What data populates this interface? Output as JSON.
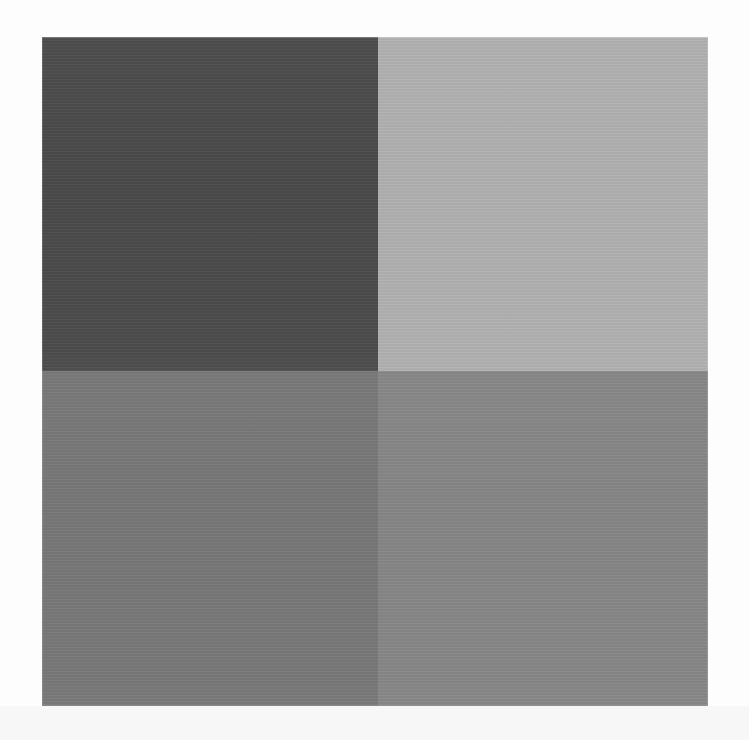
{
  "page": {
    "width": 749,
    "height": 740,
    "background_color": "#fdfdfd",
    "lower_background_color": "#f7f7f7",
    "has_text": false,
    "has_icons": false,
    "has_ui_chrome": false
  },
  "image_block": {
    "name": "four-quadrant-grayscale-block",
    "left": 42,
    "top": 37,
    "width": 666,
    "height": 669,
    "columns": [
      336,
      330
    ],
    "rows": [
      334,
      335
    ],
    "divider_x": 378,
    "divider_y": 371,
    "quadrants": [
      {
        "position": "top-left",
        "label": "dark gray patch",
        "color": "#4a4a4a",
        "luminance_estimate": 74,
        "relative_tone": "darkest"
      },
      {
        "position": "top-right",
        "label": "light gray patch",
        "color": "#b0b0b0",
        "luminance_estimate": 176,
        "relative_tone": "lightest"
      },
      {
        "position": "bottom-left",
        "label": "medium gray patch",
        "color": "#777777",
        "luminance_estimate": 119,
        "relative_tone": "mid-dark"
      },
      {
        "position": "bottom-right",
        "label": "medium light gray patch",
        "color": "#868686",
        "luminance_estimate": 134,
        "relative_tone": "mid-light"
      }
    ]
  },
  "texture": {
    "banding": "faint horizontal scan lines across all patches",
    "notable_band": "slightly lighter horizontal band near the lower edge of the bottom-left patch"
  }
}
